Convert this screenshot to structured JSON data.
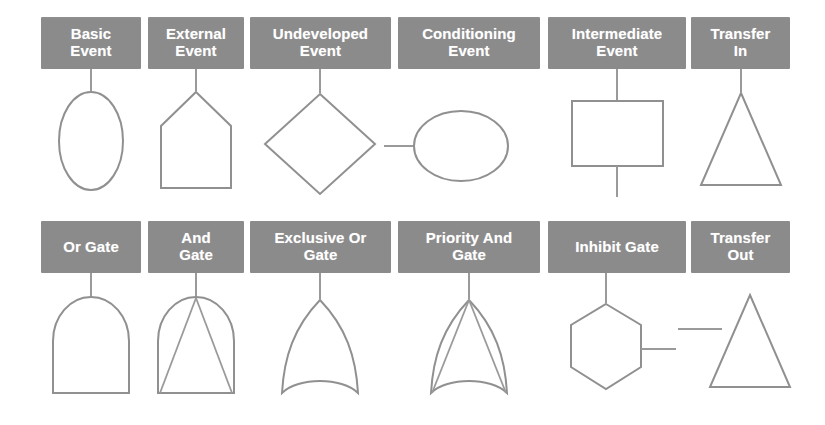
{
  "figure": {
    "background_color": "#ffffff",
    "label_box_color": "#8b8b8b",
    "label_text_color": "#ffffff",
    "shape_stroke_color": "#909090",
    "rows": 2,
    "columns": 6
  },
  "symbols": [
    {
      "id": "basic-event",
      "label_line1": "Basic",
      "label_line2": "Event",
      "shape": "ellipse-vertical",
      "connector": "top",
      "row": 1,
      "column": 1
    },
    {
      "id": "external-event",
      "label_line1": "External",
      "label_line2": "Event",
      "shape": "house-pentagon",
      "connector": "top",
      "row": 1,
      "column": 2
    },
    {
      "id": "undeveloped-event",
      "label_line1": "Undeveloped",
      "label_line2": "Event",
      "shape": "diamond",
      "connector": "top",
      "row": 1,
      "column": 3
    },
    {
      "id": "conditioning-event",
      "label_line1": "Conditioning",
      "label_line2": "Event",
      "shape": "ellipse-horizontal",
      "connector": "left",
      "row": 1,
      "column": 4
    },
    {
      "id": "intermediate-event",
      "label_line1": "Intermediate",
      "label_line2": "Event",
      "shape": "rectangle",
      "connector": "top-and-bottom",
      "row": 1,
      "column": 5
    },
    {
      "id": "transfer-in",
      "label_line1": "Transfer",
      "label_line2": "In",
      "shape": "triangle",
      "connector": "top",
      "row": 1,
      "column": 6
    },
    {
      "id": "or-gate",
      "label_line1": "Or Gate",
      "label_line2": "",
      "shape": "dome",
      "connector": "top",
      "row": 2,
      "column": 1
    },
    {
      "id": "and-gate",
      "label_line1": "And",
      "label_line2": "Gate",
      "shape": "dome-with-inner-triangle",
      "connector": "top",
      "row": 2,
      "column": 2
    },
    {
      "id": "exclusive-or-gate",
      "label_line1": "Exclusive Or",
      "label_line2": "Gate",
      "shape": "pointed-dome-concave-base",
      "connector": "top",
      "row": 2,
      "column": 3
    },
    {
      "id": "priority-and-gate",
      "label_line1": "Priority And",
      "label_line2": "Gate",
      "shape": "pointed-dome-concave-base-with-inner-lines",
      "connector": "top",
      "row": 2,
      "column": 4
    },
    {
      "id": "inhibit-gate",
      "label_line1": "Inhibit Gate",
      "label_line2": "",
      "shape": "hexagon",
      "connector": "top-and-right",
      "row": 2,
      "column": 5
    },
    {
      "id": "transfer-out",
      "label_line1": "Transfer",
      "label_line2": "Out",
      "shape": "triangle",
      "connector": "left",
      "row": 2,
      "column": 6
    }
  ]
}
